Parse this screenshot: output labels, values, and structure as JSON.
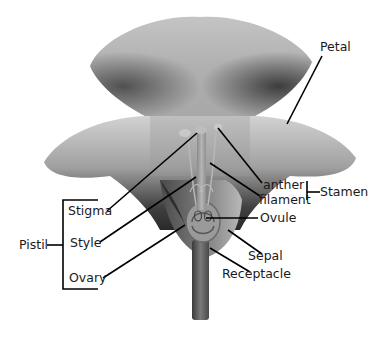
{
  "diagram": {
    "type": "labeled flower anatomy (longitudinal section)",
    "colors": {
      "background": "#ffffff",
      "petal_light": "#cfcfcf",
      "petal_dark": "#3a3a3a",
      "leader_line": "#000000",
      "text": "#1a1a1a"
    },
    "labels": {
      "petal": "Petal",
      "anther": "anther",
      "filament": "filament",
      "stamen": "Stamen",
      "ovule": "Ovule",
      "sepal": "Sepal",
      "receptacle": "Receptacle",
      "stigma": "Stigma",
      "style": "Style",
      "ovary": "Ovary",
      "pistil": "Pistil"
    },
    "groups": [
      {
        "name": "Pistil",
        "members": [
          "Stigma",
          "Style",
          "Ovary"
        ]
      },
      {
        "name": "Stamen",
        "members": [
          "anther",
          "filament"
        ]
      }
    ]
  }
}
